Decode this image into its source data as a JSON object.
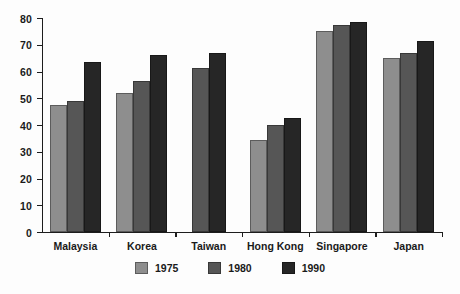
{
  "chart_data": {
    "type": "bar",
    "title": "",
    "subtitle": "",
    "xlabel": "",
    "ylabel": "",
    "ylim": [
      0,
      80
    ],
    "yticks": [
      0,
      10,
      20,
      30,
      40,
      50,
      60,
      70,
      80
    ],
    "ytick_labels": [
      "0",
      "10",
      "20",
      "30",
      "40",
      "50",
      "60",
      "70",
      "80"
    ],
    "grid": false,
    "legend_position": "bottom-center",
    "categories": [
      "Malaysia",
      "Korea",
      "Taiwan",
      "Hong Kong",
      "Singapore",
      "Japan"
    ],
    "series": [
      {
        "name": "1975",
        "color": "#8e8e8e",
        "values": [
          47.5,
          52.0,
          null,
          34.5,
          75.0,
          65.0
        ]
      },
      {
        "name": "1980",
        "color": "#565656",
        "values": [
          49.0,
          56.5,
          61.5,
          40.0,
          77.5,
          67.0
        ]
      },
      {
        "name": "1990",
        "color": "#262626",
        "values": [
          63.5,
          66.0,
          67.0,
          42.5,
          78.5,
          71.5
        ]
      }
    ]
  },
  "legend": {
    "items": [
      {
        "label": "1975",
        "color": "#8e8e8e"
      },
      {
        "label": "1980",
        "color": "#565656"
      },
      {
        "label": "1990",
        "color": "#262626"
      }
    ]
  },
  "axes": {
    "y_tick_labels": [
      "80",
      "70",
      "60",
      "50",
      "40",
      "30",
      "20",
      "10",
      "0"
    ],
    "x_tick_labels": [
      "Malaysia",
      "Korea",
      "Taiwan",
      "Hong Kong",
      "Singapore",
      "Japan"
    ]
  }
}
